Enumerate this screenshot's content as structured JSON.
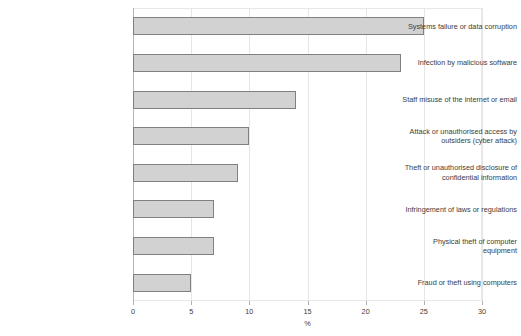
{
  "chart_data": {
    "type": "bar",
    "orientation": "horizontal",
    "title": "",
    "xlabel": "%",
    "ylabel": "",
    "xlim": [
      0,
      30
    ],
    "xticks": [
      0,
      5,
      10,
      15,
      20,
      25,
      30
    ],
    "xtick_labels": [
      "0",
      "5",
      "10",
      "15",
      "20",
      "25",
      "30"
    ],
    "grid": true,
    "legend": false,
    "categories": [
      "Systems failure or data corruption",
      "Infection by malicious software",
      "Staff misuse of the internet or email",
      "Attack or unauthorised access by outsiders (cyber attack)",
      "Theft or unauthorised disclosure of confidential information",
      "Infringement of laws or regulations",
      "Physical theft of computer equipment",
      "Fraud or theft using computers"
    ],
    "category_lines": [
      [
        "Systems failure or data corruption"
      ],
      [
        "Infection by malicious software"
      ],
      [
        "Staff misuse of the internet or email"
      ],
      [
        "Attack or unauthorised access by",
        "outsiders (cyber attack)"
      ],
      [
        "Theft or unauthorised disclosure of",
        "confidential information"
      ],
      [
        "Infringement of laws or regulations"
      ],
      [
        "Physical theft of computer",
        "equipment"
      ],
      [
        "Fraud or theft using computers"
      ]
    ],
    "values": [
      25,
      23,
      14,
      10,
      9,
      7,
      7,
      5
    ],
    "colors": {
      "bar_fill": "#d2d2d2",
      "bar_border": "#808080",
      "grid": "#e6e6e6",
      "axis": "#b4b4b4",
      "text": "#3c3c3c",
      "background": "#ffffff"
    }
  }
}
